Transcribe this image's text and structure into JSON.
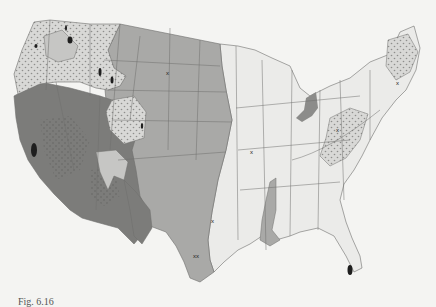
{
  "figure": {
    "type": "map",
    "caption_partial": "Fig. 6.16"
  },
  "colors": {
    "background": "#f4f4f2",
    "land_light": "#ebebe9",
    "mid_gray": "#a9a9a7",
    "dark_gray": "#7c7c7a",
    "stipple_region": "#d8d8d6",
    "stipple_dot": "#8e8e8c",
    "state_line": "#6f6f6d",
    "spot": "#1e1e1e"
  },
  "legend_regions": [
    {
      "name": "dark-southwest",
      "shade": "dark"
    },
    {
      "name": "mid-plains",
      "shade": "mid"
    },
    {
      "name": "stippled-mountains",
      "shade": "stipple"
    },
    {
      "name": "light-east",
      "shade": "light"
    }
  ],
  "markers": [
    {
      "label": "x",
      "x": 168,
      "y": 73
    },
    {
      "label": "x",
      "x": 252,
      "y": 152
    },
    {
      "label": "x",
      "x": 213,
      "y": 221
    },
    {
      "label": "xx",
      "x": 197,
      "y": 256
    },
    {
      "label": "x",
      "x": 338,
      "y": 130
    },
    {
      "label": "x",
      "x": 398,
      "y": 83
    }
  ]
}
